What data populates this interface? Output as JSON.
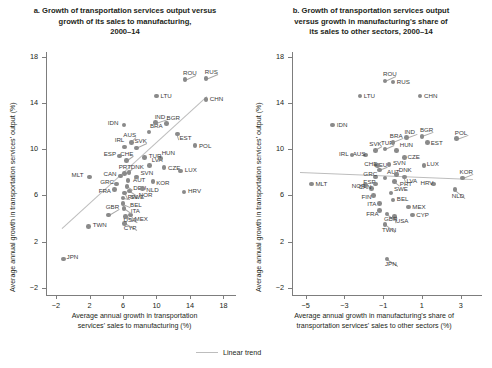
{
  "figure": {
    "legend_label": "Linear trend",
    "trend_color": "#bdbdbd",
    "point_color": "#8a8a8a",
    "axis_color": "#7d7d7d"
  },
  "chart_data": [
    {
      "type": "scatter",
      "panel": "a",
      "title": "a. Growth of transportation services output versus growth of its sales to manufacturing, 2000–14",
      "xlabel": "Average annual growth in transportation services' sales to manufacturing (%)",
      "ylabel": "Average annual growth in transportation services' output (%)",
      "xlim": [
        -3.2,
        19.5
      ],
      "ylim": [
        -2.6,
        18.4
      ],
      "xticks": [
        -2,
        2,
        6,
        10,
        14,
        18
      ],
      "yticks": [
        -2,
        2,
        6,
        10,
        14,
        18
      ],
      "grid": false,
      "legend_position": "bottom-center",
      "trendline": {
        "label": "Linear trend",
        "x0": -1.3,
        "y0": 3.2,
        "x1": 16.0,
        "y1": 14.6
      },
      "points": [
        {
          "code": "JPN",
          "x": -1.1,
          "y": 0.5,
          "lx": 3,
          "ly": -2
        },
        {
          "code": "TWN",
          "x": 1.9,
          "y": 3.3,
          "lx": 4,
          "ly": -2
        },
        {
          "code": "MLT",
          "x": 2.0,
          "y": 7.6,
          "lx": -18,
          "ly": -2
        },
        {
          "code": "GBR",
          "x": 4.3,
          "y": 4.3,
          "lx": -3,
          "ly": -8
        },
        {
          "code": "CYP",
          "x": 6.2,
          "y": 3.6,
          "lx": -1,
          "ly": 5
        },
        {
          "code": "USA",
          "x": 6.3,
          "y": 4.2,
          "lx": -2,
          "ly": 4
        },
        {
          "code": "MEX",
          "x": 6.9,
          "y": 4.3,
          "lx": 4,
          "ly": 4
        },
        {
          "code": "ITA",
          "x": 6.1,
          "y": 4.9,
          "lx": 7,
          "ly": 3
        },
        {
          "code": "BEL",
          "x": 6.0,
          "y": 5.3,
          "lx": 7,
          "ly": 1
        },
        {
          "code": "SWE",
          "x": 6.0,
          "y": 5.8,
          "lx": 7,
          "ly": -1
        },
        {
          "code": "FRA",
          "x": 5.0,
          "y": 6.5,
          "lx": -16,
          "ly": 1
        },
        {
          "code": "GRC",
          "x": 5.2,
          "y": 7.0,
          "lx": -16,
          "ly": -2
        },
        {
          "code": "FIN",
          "x": 6.2,
          "y": 6.2,
          "lx": 3,
          "ly": 4
        },
        {
          "code": "NOR",
          "x": 6.8,
          "y": 6.4,
          "lx": 9,
          "ly": 4
        },
        {
          "code": "DEU",
          "x": 6.5,
          "y": 6.8,
          "lx": 6,
          "ly": 2
        },
        {
          "code": "NLD",
          "x": 8.3,
          "y": 6.6,
          "lx": 4,
          "ly": 1
        },
        {
          "code": "AUT",
          "x": 6.6,
          "y": 7.3,
          "lx": 5,
          "ly": 0
        },
        {
          "code": "CAN",
          "x": 5.7,
          "y": 7.7,
          "lx": -17,
          "ly": -2
        },
        {
          "code": "PRT",
          "x": 6.2,
          "y": 7.9,
          "lx": -6,
          "ly": -7
        },
        {
          "code": "DNK",
          "x": 6.7,
          "y": 8.0,
          "lx": 2,
          "ly": -5
        },
        {
          "code": "SVN",
          "x": 7.6,
          "y": 7.6,
          "lx": 4,
          "ly": -4
        },
        {
          "code": "KOR",
          "x": 9.6,
          "y": 7.2,
          "lx": 3,
          "ly": 1
        },
        {
          "code": "CZE",
          "x": 10.9,
          "y": 8.4,
          "lx": 4,
          "ly": 0
        },
        {
          "code": "LVA",
          "x": 9.2,
          "y": 8.6,
          "lx": 2,
          "ly": -5
        },
        {
          "code": "HUN",
          "x": 10.5,
          "y": 9.2,
          "lx": 1,
          "ly": -5
        },
        {
          "code": "LUX",
          "x": 12.9,
          "y": 8.1,
          "lx": 4,
          "ly": -1
        },
        {
          "code": "HRV",
          "x": 13.3,
          "y": 6.3,
          "lx": 4,
          "ly": -1
        },
        {
          "code": "CHE",
          "x": 6.4,
          "y": 9.0,
          "lx": -6,
          "ly": -7
        },
        {
          "code": "ESP",
          "x": 5.6,
          "y": 9.4,
          "lx": -16,
          "ly": -2
        },
        {
          "code": "IRL",
          "x": 6.2,
          "y": 10.2,
          "lx": -10,
          "ly": -7
        },
        {
          "code": "SVK",
          "x": 7.6,
          "y": 10.1,
          "lx": -2,
          "ly": -7
        },
        {
          "code": "AUS",
          "x": 7.0,
          "y": 10.6,
          "lx": -8,
          "ly": -7
        },
        {
          "code": "TUR",
          "x": 8.6,
          "y": 9.3,
          "lx": 4,
          "ly": -1
        },
        {
          "code": "IDN",
          "x": 6.1,
          "y": 12.1,
          "lx": -16,
          "ly": -2
        },
        {
          "code": "BRA",
          "x": 9.1,
          "y": 11.5,
          "lx": 1,
          "ly": -6
        },
        {
          "code": "IND",
          "x": 9.9,
          "y": 12.3,
          "lx": -1,
          "ly": -6
        },
        {
          "code": "BGR",
          "x": 11.2,
          "y": 12.2,
          "lx": 0,
          "ly": -6
        },
        {
          "code": "EST",
          "x": 12.5,
          "y": 11.3,
          "lx": 2,
          "ly": 4
        },
        {
          "code": "POL",
          "x": 14.6,
          "y": 10.3,
          "lx": 4,
          "ly": 0
        },
        {
          "code": "LTU",
          "x": 10.0,
          "y": 14.6,
          "lx": 4,
          "ly": 0
        },
        {
          "code": "ROU",
          "x": 13.4,
          "y": 16.0,
          "lx": -2,
          "ly": -7
        },
        {
          "code": "RUS",
          "x": 15.9,
          "y": 16.1,
          "lx": -1,
          "ly": -7
        },
        {
          "code": "CHN",
          "x": 15.9,
          "y": 14.3,
          "lx": 4,
          "ly": 0
        }
      ]
    },
    {
      "type": "scatter",
      "panel": "b",
      "title": "b. Growth of transportation services output versus growth in manufacturing's share of its sales to other sectors, 2000–14",
      "xlabel": "Average annual growth in manufacturing's share of transportation services' sales to other sectors (%)",
      "ylabel": "Average annual growth in transportation services' output (%)",
      "xlim": [
        -5.7,
        4.1
      ],
      "ylim": [
        -2.6,
        18.4
      ],
      "xticks": [
        -5,
        -3,
        -1,
        1,
        3
      ],
      "yticks": [
        -2,
        2,
        6,
        10,
        14,
        18
      ],
      "grid": false,
      "legend_position": "bottom-center",
      "trendline": {
        "label": "Linear trend",
        "x0": -5.3,
        "y0": 8.0,
        "x1": 3.6,
        "y1": 7.4
      },
      "points": [
        {
          "code": "JPN",
          "x": -0.8,
          "y": 0.5,
          "lx": -2,
          "ly": 5
        },
        {
          "code": "TWN",
          "x": -0.9,
          "y": 3.5,
          "lx": -3,
          "ly": 6
        },
        {
          "code": "USA",
          "x": -0.4,
          "y": 4.2,
          "lx": 1,
          "ly": 5
        },
        {
          "code": "CYP",
          "x": 0.5,
          "y": 4.3,
          "lx": 4,
          "ly": 0
        },
        {
          "code": "GBR",
          "x": -0.8,
          "y": 4.4,
          "lx": -3,
          "ly": 5
        },
        {
          "code": "FRA",
          "x": -1.2,
          "y": 4.7,
          "lx": -13,
          "ly": 3
        },
        {
          "code": "MEX",
          "x": 0.3,
          "y": 5.0,
          "lx": 4,
          "ly": 0
        },
        {
          "code": "ITA",
          "x": -1.2,
          "y": 5.3,
          "lx": -12,
          "ly": 0
        },
        {
          "code": "BEL",
          "x": -0.5,
          "y": 5.6,
          "lx": 4,
          "ly": -1
        },
        {
          "code": "FIN",
          "x": -1.5,
          "y": 6.0,
          "lx": -12,
          "ly": 2
        },
        {
          "code": "SWE",
          "x": -0.6,
          "y": 6.2,
          "lx": 3,
          "ly": -4
        },
        {
          "code": "CAN",
          "x": -1.6,
          "y": 6.6,
          "lx": -13,
          "ly": -2
        },
        {
          "code": "NLD",
          "x": 2.7,
          "y": 6.5,
          "lx": -3,
          "ly": 6
        },
        {
          "code": "ESP",
          "x": -1.4,
          "y": 7.0,
          "lx": -12,
          "ly": -2
        },
        {
          "code": "NOR",
          "x": -1.9,
          "y": 6.9,
          "lx": -14,
          "ly": 1
        },
        {
          "code": "HRV",
          "x": 1.6,
          "y": 7.0,
          "lx": -13,
          "ly": -1
        },
        {
          "code": "PRT",
          "x": -0.4,
          "y": 7.2,
          "lx": 5,
          "ly": 2
        },
        {
          "code": "AUT",
          "x": -0.9,
          "y": 7.5,
          "lx": 2,
          "ly": -6
        },
        {
          "code": "GRC",
          "x": -1.4,
          "y": 7.6,
          "lx": -12,
          "ly": -3
        },
        {
          "code": "DNK",
          "x": -0.3,
          "y": 7.8,
          "lx": 2,
          "ly": -5
        },
        {
          "code": "LVA",
          "x": 0.1,
          "y": 7.6,
          "lx": 2,
          "ly": 4
        },
        {
          "code": "KOR",
          "x": 3.1,
          "y": 7.5,
          "lx": -3,
          "ly": -6
        },
        {
          "code": "DEU",
          "x": -1.2,
          "y": 8.2,
          "lx": -5,
          "ly": -5
        },
        {
          "code": "CHE",
          "x": -1.3,
          "y": 8.6,
          "lx": -13,
          "ly": -1
        },
        {
          "code": "SVN",
          "x": -0.7,
          "y": 8.7,
          "lx": 4,
          "ly": -1
        },
        {
          "code": "LUX",
          "x": 1.1,
          "y": 8.6,
          "lx": 3,
          "ly": -1
        },
        {
          "code": "AUS",
          "x": -1.9,
          "y": 9.5,
          "lx": -13,
          "ly": -1
        },
        {
          "code": "IRL",
          "x": -2.6,
          "y": 9.5,
          "lx": -13,
          "ly": -1
        },
        {
          "code": "CZE",
          "x": 0.1,
          "y": 9.3,
          "lx": 3,
          "ly": 0
        },
        {
          "code": "SVK",
          "x": -1.4,
          "y": 9.9,
          "lx": -6,
          "ly": -6
        },
        {
          "code": "TUR",
          "x": -0.9,
          "y": 10.0,
          "lx": -4,
          "ly": -6
        },
        {
          "code": "HUN",
          "x": -0.3,
          "y": 9.9,
          "lx": 3,
          "ly": -5
        },
        {
          "code": "BRA",
          "x": -0.5,
          "y": 10.6,
          "lx": -3,
          "ly": -6
        },
        {
          "code": "IND",
          "x": 0.2,
          "y": 11.0,
          "lx": -2,
          "ly": -6
        },
        {
          "code": "BGR",
          "x": 1.0,
          "y": 11.1,
          "lx": -2,
          "ly": -6
        },
        {
          "code": "EST",
          "x": 1.3,
          "y": 10.6,
          "lx": 3,
          "ly": 1
        },
        {
          "code": "POL",
          "x": 2.8,
          "y": 10.9,
          "lx": -2,
          "ly": -6
        },
        {
          "code": "MLT",
          "x": -4.7,
          "y": 7.0,
          "lx": 4,
          "ly": 0
        },
        {
          "code": "IDN",
          "x": -3.6,
          "y": 12.1,
          "lx": 4,
          "ly": 0
        },
        {
          "code": "LTU",
          "x": -2.2,
          "y": 14.6,
          "lx": 4,
          "ly": 0
        },
        {
          "code": "ROU",
          "x": -0.9,
          "y": 15.9,
          "lx": -2,
          "ly": -7
        },
        {
          "code": "RUS",
          "x": -0.5,
          "y": 15.8,
          "lx": 4,
          "ly": 0
        },
        {
          "code": "CHN",
          "x": 0.9,
          "y": 14.6,
          "lx": 4,
          "ly": 0
        }
      ]
    }
  ]
}
